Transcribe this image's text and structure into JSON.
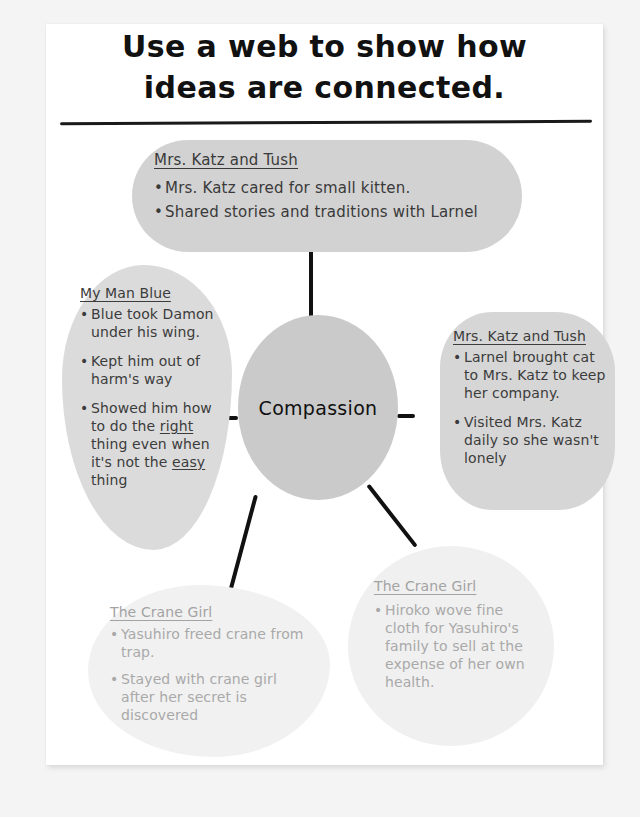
{
  "page": {
    "title_line_1": "Use a web to show how",
    "title_line_2": "ideas are connected."
  },
  "center": {
    "label": "Compassion"
  },
  "bubbles": {
    "top": {
      "heading": "Mrs. Katz and Tush",
      "bullets": [
        "Mrs. Katz cared for small kitten.",
        "Shared stories and traditions with Larnel"
      ]
    },
    "left": {
      "heading": "My Man Blue",
      "bullets": [
        "Blue took Damon under his wing.",
        "Kept him out of harm's way"
      ],
      "bullet_3_part_1": "Showed him how to do the ",
      "bullet_3_emphasis_1": "right",
      "bullet_3_part_2": " thing even when it's not the ",
      "bullet_3_emphasis_2": "easy",
      "bullet_3_part_3": " thing"
    },
    "right": {
      "heading": "Mrs. Katz and Tush",
      "bullets": [
        "Larnel brought cat to Mrs. Katz to keep her company.",
        "Visited Mrs. Katz daily so she wasn't lonely"
      ]
    },
    "bottom_left": {
      "heading": "The Crane Girl",
      "bullets": [
        "Yasuhiro freed crane from trap.",
        "Stayed with crane girl after her secret is discovered"
      ]
    },
    "bottom_right": {
      "heading": "The Crane Girl",
      "bullets": [
        "Hiroko wove fine cloth for Yasuhiro's family to sell at the expense of her own health."
      ]
    }
  },
  "colors": {
    "paper": "#ffffff",
    "backdrop": "#f4f4f4",
    "bubble_medium": "#d6d6d6",
    "bubble_faded": "#f0f0f0",
    "center_fill": "#cacaca",
    "ink": "#111111",
    "ink_gray": "#3c3c3c",
    "ink_faded": "#a9a9a9"
  }
}
